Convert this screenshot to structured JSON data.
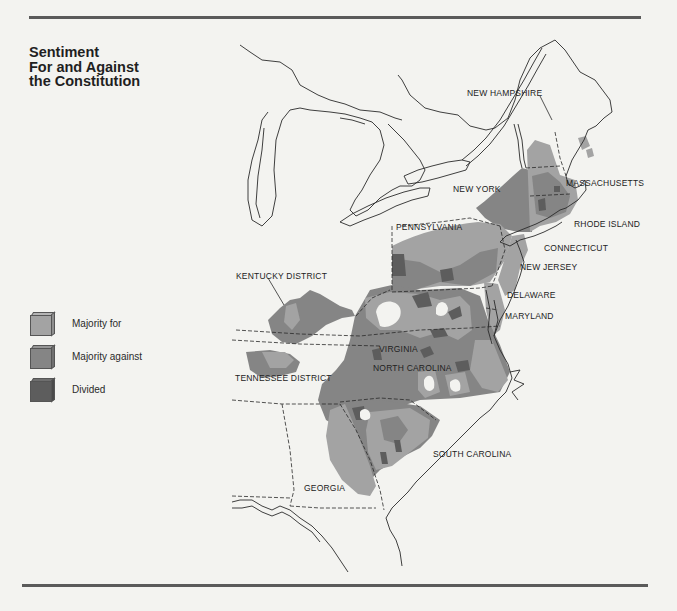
{
  "title": {
    "lines": [
      "Sentiment",
      "For and Against",
      "the Constitution"
    ]
  },
  "colors": {
    "background": "#f3f3f0",
    "majority_for": "#a3a3a3",
    "majority_against": "#858585",
    "divided": "#5d5d5d",
    "outline": "#2a2a2a",
    "rule": "#5a5a5a"
  },
  "legend": {
    "items": [
      {
        "key": "majority_for",
        "label": "Majority for",
        "color": "#a3a3a3"
      },
      {
        "key": "majority_against",
        "label": "Majority against",
        "color": "#858585"
      },
      {
        "key": "divided",
        "label": "Divided",
        "color": "#5d5d5d"
      }
    ]
  },
  "labels": {
    "new_hampshire": "NEW HAMPSHIRE",
    "massachusetts": "MASSACHUSETTS",
    "new_york": "NEW YORK",
    "rhode_island": "RHODE ISLAND",
    "connecticut": "CONNECTICUT",
    "pennsylvania": "PENNSYLVANIA",
    "new_jersey": "NEW JERSEY",
    "delaware": "DELAWARE",
    "maryland": "MARYLAND",
    "kentucky_district": "KENTUCKY DISTRICT",
    "virginia": "VIRGINIA",
    "north_carolina": "NORTH CAROLINA",
    "tennessee_district": "TENNESSEE DISTRICT",
    "south_carolina": "SOUTH CAROLINA",
    "georgia": "GEORGIA"
  }
}
